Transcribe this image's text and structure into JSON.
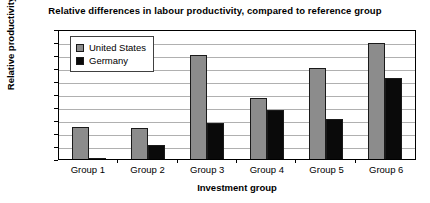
{
  "chart_data": {
    "type": "bar",
    "title": "Relative differences in labour productivity, compared to reference group",
    "xlabel": "Investment group",
    "ylabel": "Relative productivity",
    "categories": [
      "Group 1",
      "Group 2",
      "Group 3",
      "Group 4",
      "Group 5",
      "Group 6"
    ],
    "series": [
      {
        "name": "United States",
        "color": "#8c8c8c",
        "values": [
          0.25,
          0.24,
          0.8,
          0.47,
          0.7,
          0.89
        ]
      },
      {
        "name": "Germany",
        "color": "#0a0a0a",
        "values": [
          0.01,
          0.11,
          0.28,
          0.38,
          0.31,
          0.62
        ]
      }
    ],
    "ylim": [
      0,
      1
    ],
    "ytick_labels": [
      "1",
      "0.9",
      "0.8",
      "0.7",
      "0.6",
      "0.5",
      "0.4",
      "0.3",
      "0.2",
      "0.1",
      "0"
    ],
    "ytick_values": [
      1,
      0.9,
      0.8,
      0.7,
      0.6,
      0.5,
      0.4,
      0.3,
      0.2,
      0.1,
      0
    ],
    "grid": true,
    "legend_position": "top-left"
  }
}
